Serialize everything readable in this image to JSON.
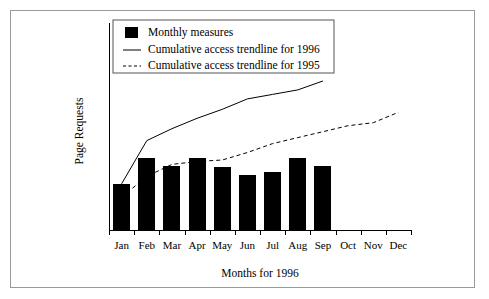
{
  "chart_data": {
    "type": "bar",
    "title": "",
    "xlabel": "Months for 1996",
    "ylabel": "Page Requests",
    "categories": [
      "Jan",
      "Feb",
      "Mar",
      "Apr",
      "May",
      "Jun",
      "Jul",
      "Aug",
      "Sep",
      "Oct",
      "Nov",
      "Dec"
    ],
    "grid": false,
    "legend_position": "top-left",
    "ylim": [
      0,
      100
    ],
    "axis_ticks_visible": true,
    "y_tick_labels": [],
    "series": [
      {
        "name": "Monthly measures",
        "type": "bar",
        "marker": "filled-square",
        "color": "#000000",
        "values": [
          31,
          48,
          43,
          48,
          42,
          37,
          39,
          48,
          43,
          null,
          null,
          null
        ]
      },
      {
        "name": "Cumulative access trendline for 1996",
        "type": "line",
        "style": "solid",
        "color": "#000000",
        "values": [
          31,
          60,
          68,
          75,
          81,
          88,
          91,
          94,
          100,
          null,
          null,
          null
        ]
      },
      {
        "name": "Cumulative access trendline for 1995",
        "type": "line",
        "style": "dashed",
        "color": "#000000",
        "values": [
          22,
          36,
          44,
          46,
          47,
          52,
          58,
          62,
          66,
          70,
          72,
          79
        ]
      }
    ]
  },
  "legend": {
    "entries": [
      {
        "label": "Monthly measures",
        "marker": "filled-square"
      },
      {
        "label": "Cumulative access trendline for 1996",
        "marker": "solid-line"
      },
      {
        "label": "Cumulative access trendline for 1995",
        "marker": "dashed-line"
      }
    ]
  },
  "colors": {
    "ink": "#000000",
    "frame": "#9a9a9a",
    "legend_border": "#555555",
    "background": "#ffffff"
  }
}
